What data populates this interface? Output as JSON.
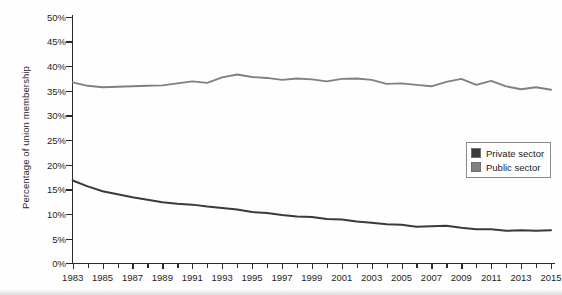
{
  "chart_data": {
    "type": "line",
    "title": "",
    "xlabel": "",
    "ylabel": "Percentage of union membership",
    "xlim": [
      1983,
      2015
    ],
    "ylim": [
      0,
      50
    ],
    "grid": false,
    "legend_position": "center-right",
    "y_tick_labels": [
      "50%",
      "45%",
      "40%",
      "35%",
      "30%",
      "25%",
      "20%",
      "15%",
      "10%",
      "5%",
      "0%"
    ],
    "y_ticks": [
      50,
      45,
      40,
      35,
      30,
      25,
      20,
      15,
      10,
      5,
      0
    ],
    "x_tick_labels": [
      "1983",
      "1985",
      "1987",
      "1989",
      "1991",
      "1993",
      "1995",
      "1997",
      "1999",
      "2001",
      "2003",
      "2005",
      "2007",
      "2009",
      "2011",
      "2013",
      "2015"
    ],
    "x_ticks": [
      1983,
      1985,
      1987,
      1989,
      1991,
      1993,
      1995,
      1997,
      1999,
      2001,
      2003,
      2005,
      2007,
      2009,
      2011,
      2013,
      2015
    ],
    "x": [
      1983,
      1984,
      1985,
      1986,
      1987,
      1988,
      1989,
      1990,
      1991,
      1992,
      1993,
      1994,
      1995,
      1996,
      1997,
      1998,
      1999,
      2000,
      2001,
      2002,
      2003,
      2004,
      2005,
      2006,
      2007,
      2008,
      2009,
      2010,
      2011,
      2012,
      2013,
      2014,
      2015
    ],
    "series": [
      {
        "name": "Private sector",
        "color": "#3a3a3a",
        "values": [
          16.8,
          15.6,
          14.6,
          14.0,
          13.4,
          12.9,
          12.4,
          12.1,
          11.9,
          11.5,
          11.2,
          10.9,
          10.4,
          10.2,
          9.8,
          9.5,
          9.4,
          9.0,
          8.9,
          8.5,
          8.2,
          7.9,
          7.8,
          7.4,
          7.5,
          7.6,
          7.2,
          6.9,
          6.9,
          6.6,
          6.7,
          6.6,
          6.7
        ]
      },
      {
        "name": "Public sector",
        "color": "#808080",
        "values": [
          36.7,
          36.0,
          35.7,
          35.8,
          35.9,
          36.0,
          36.1,
          36.5,
          36.9,
          36.6,
          37.7,
          38.3,
          37.8,
          37.6,
          37.2,
          37.5,
          37.3,
          36.9,
          37.4,
          37.5,
          37.2,
          36.4,
          36.5,
          36.2,
          35.9,
          36.8,
          37.4,
          36.2,
          37.0,
          35.9,
          35.3,
          35.7,
          35.2
        ]
      }
    ],
    "annotations": []
  },
  "legend": {
    "items": [
      {
        "label": "Private sector",
        "color": "#3a3a3a"
      },
      {
        "label": "Public sector",
        "color": "#808080"
      }
    ]
  }
}
